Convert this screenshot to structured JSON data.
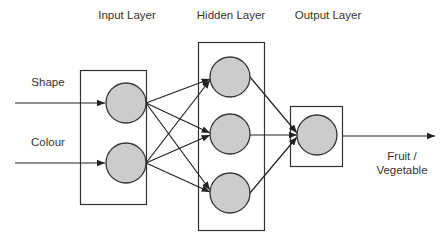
{
  "diagram": {
    "type": "neural-network",
    "layers": [
      {
        "id": "input",
        "label": "Input Layer",
        "nodes": 2
      },
      {
        "id": "hidden",
        "label": "Hidden Layer",
        "nodes": 3
      },
      {
        "id": "output",
        "label": "Output Layer",
        "nodes": 1
      }
    ],
    "inputs": [
      {
        "label": "Shape"
      },
      {
        "label": "Colour"
      }
    ],
    "output": {
      "label_line1": "Fruit /",
      "label_line2": "Vegetable"
    },
    "colors": {
      "node_fill": "#cccccc",
      "node_stroke": "#333333",
      "box_stroke": "#333333",
      "arrow": "#222222",
      "text": "#333333"
    }
  }
}
